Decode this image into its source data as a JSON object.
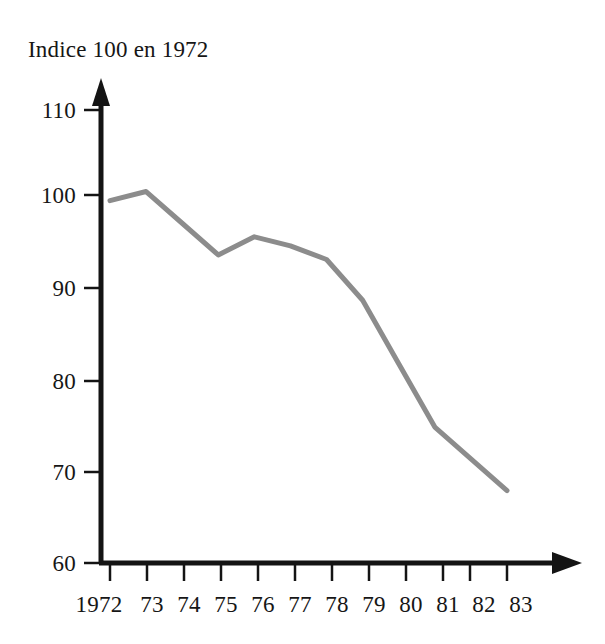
{
  "chart_data": {
    "type": "line",
    "title": "Indice 100 en 1972",
    "xlabel": "",
    "ylabel": "",
    "grid": false,
    "legend": null,
    "legend_position": "none",
    "line_color": "#8c8c8c",
    "axis_color": "#141414",
    "ylim": [
      60,
      110
    ],
    "yticks": [
      60,
      70,
      80,
      90,
      100,
      110
    ],
    "ytick_labels": [
      "60",
      "70",
      "80",
      "90",
      "100",
      "110"
    ],
    "x": [
      1972,
      1973,
      1974,
      1975,
      1976,
      1977,
      1978,
      1979,
      1980,
      1981,
      1982,
      1983
    ],
    "xtick_labels": [
      "1972",
      "73",
      "74",
      "75",
      "76",
      "77",
      "78",
      "79",
      "80",
      "81",
      "82",
      "83"
    ],
    "categories": [
      "1972",
      "73",
      "74",
      "75",
      "76",
      "77",
      "78",
      "79",
      "80",
      "81",
      "82",
      "83"
    ],
    "values": [
      100,
      101,
      97.5,
      94,
      96,
      95,
      93.5,
      89,
      82,
      75,
      71.5,
      68
    ],
    "series": [
      {
        "name": "Indice",
        "values": [
          100,
          101,
          97.5,
          94,
          96,
          95,
          93.5,
          89,
          82,
          75,
          71.5,
          68
        ]
      }
    ]
  },
  "axes": {
    "y_axis_name": "y-axis",
    "x_axis_name": "x-axis",
    "arrow_heads": true
  }
}
